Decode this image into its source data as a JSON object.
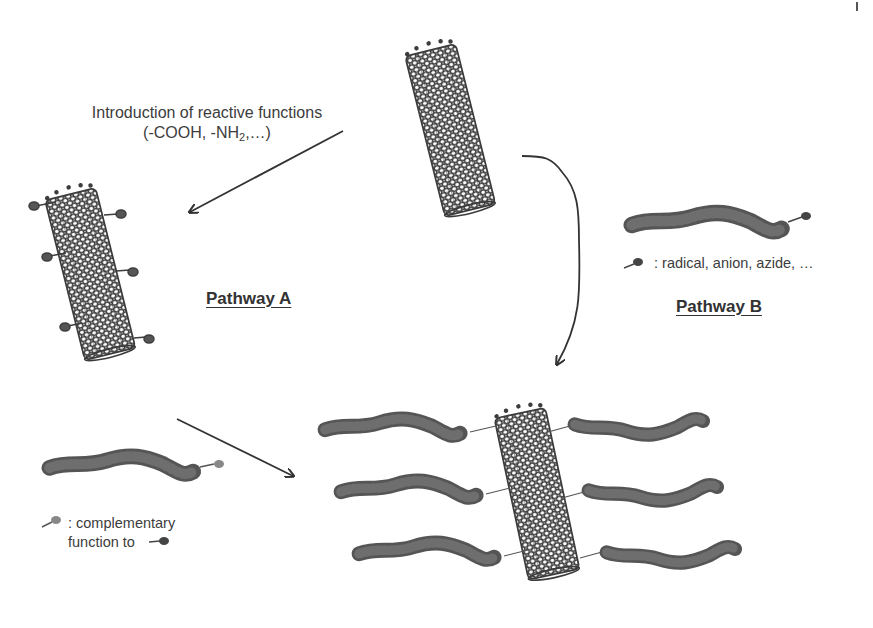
{
  "figure": {
    "background": "#ffffff",
    "ink_color": "#3a3a3a",
    "nanotube_color": "#3c3c3c",
    "polymer_color": "#5e5e5e",
    "intro_label": {
      "line1": "Introduction of reactive functions",
      "line2_prefix": "(-COOH, -NH",
      "line2_sub": "2",
      "line2_suffix": ",…)"
    },
    "pathways": [
      {
        "id": "A",
        "label": "Pathway A"
      },
      {
        "id": "B",
        "label": "Pathway B"
      }
    ],
    "legends": {
      "pathway_b": {
        "icon": "reactive-end-group-icon",
        "text": ": radical, anion, azide, …"
      },
      "pathway_a": {
        "icon": "complementary-end-group-icon",
        "line1": ": complementary",
        "line2": "function to",
        "ref_icon": "reactive-function-icon"
      }
    },
    "components": [
      {
        "name": "pristine-nanotube",
        "position": "top-center"
      },
      {
        "name": "functionalized-nanotube",
        "position": "left",
        "functional_groups": 6
      },
      {
        "name": "polymer-with-reactive-end",
        "position": "right"
      },
      {
        "name": "polymer-with-complementary-end",
        "position": "bottom-left"
      },
      {
        "name": "polymer-grafted-nanotube",
        "position": "bottom-center",
        "grafted_chains": 6
      }
    ],
    "arrows": [
      {
        "name": "arrow-to-functionalized",
        "from": "pristine-nanotube",
        "to": "functionalized-nanotube"
      },
      {
        "name": "arrow-pathway-a",
        "from": "functionalized-nanotube",
        "to": "polymer-grafted-nanotube"
      },
      {
        "name": "arrow-pathway-b",
        "from": "pristine-nanotube",
        "to": "polymer-grafted-nanotube"
      }
    ]
  }
}
